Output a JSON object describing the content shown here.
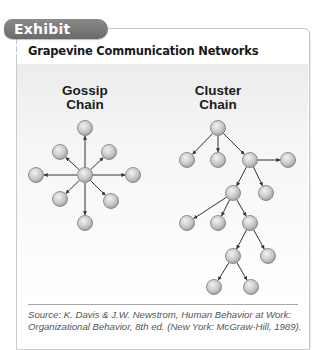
{
  "exhibit": {
    "tab_label": "Exhibit 13.3",
    "title": "Grapevine Communication Networks",
    "source": "Source: K. Davis & J.W. Newstrom, Human Behavior at Work: Organizational Behavior, 8th ed. (New York: McGraw-Hill, 1989).",
    "colors": {
      "tab": "#7a7a7a",
      "node_fill": "#c8c8c8",
      "edge": "#333333",
      "content_bg_top": "#ececec"
    }
  },
  "diagrams": [
    {
      "name": "gossip-chain",
      "label_line1": "Gossip",
      "label_line2": "Chain",
      "structure": "star: one central node sends to eight surrounding nodes",
      "nodes": [
        {
          "id": "center",
          "x": 85,
          "y": 175
        },
        {
          "id": "top",
          "x": 85,
          "y": 128
        },
        {
          "id": "upper-left",
          "x": 60,
          "y": 152
        },
        {
          "id": "upper-right",
          "x": 109,
          "y": 152
        },
        {
          "id": "left",
          "x": 36,
          "y": 175
        },
        {
          "id": "right",
          "x": 133,
          "y": 175
        },
        {
          "id": "lower-left",
          "x": 60,
          "y": 199
        },
        {
          "id": "lower-right",
          "x": 111,
          "y": 201
        },
        {
          "id": "bottom",
          "x": 85,
          "y": 223
        }
      ],
      "edges": [
        [
          "center",
          "top"
        ],
        [
          "center",
          "upper-left"
        ],
        [
          "center",
          "upper-right"
        ],
        [
          "center",
          "left"
        ],
        [
          "center",
          "right"
        ],
        [
          "center",
          "lower-left"
        ],
        [
          "center",
          "lower-right"
        ],
        [
          "center",
          "bottom"
        ]
      ]
    },
    {
      "name": "cluster-chain",
      "label_line1": "Cluster",
      "label_line2": "Chain",
      "structure": "tree: select individuals pass information to a few others",
      "nodes": [
        {
          "id": "n1",
          "x": 218,
          "y": 128
        },
        {
          "id": "n2",
          "x": 187,
          "y": 160
        },
        {
          "id": "n3",
          "x": 218,
          "y": 160
        },
        {
          "id": "n4",
          "x": 250,
          "y": 160
        },
        {
          "id": "n5",
          "x": 288,
          "y": 160
        },
        {
          "id": "n6",
          "x": 233,
          "y": 193
        },
        {
          "id": "n7",
          "x": 266,
          "y": 193
        },
        {
          "id": "n8",
          "x": 187,
          "y": 223
        },
        {
          "id": "n9",
          "x": 218,
          "y": 223
        },
        {
          "id": "n10",
          "x": 250,
          "y": 223
        },
        {
          "id": "n11",
          "x": 233,
          "y": 256
        },
        {
          "id": "n12",
          "x": 268,
          "y": 256
        },
        {
          "id": "n13",
          "x": 214,
          "y": 287
        },
        {
          "id": "n14",
          "x": 251,
          "y": 287
        }
      ],
      "edges": [
        [
          "n1",
          "n2"
        ],
        [
          "n1",
          "n3"
        ],
        [
          "n1",
          "n4"
        ],
        [
          "n4",
          "n5"
        ],
        [
          "n4",
          "n6"
        ],
        [
          "n4",
          "n7"
        ],
        [
          "n6",
          "n8"
        ],
        [
          "n6",
          "n9"
        ],
        [
          "n6",
          "n10"
        ],
        [
          "n10",
          "n11"
        ],
        [
          "n10",
          "n12"
        ],
        [
          "n11",
          "n13"
        ],
        [
          "n11",
          "n14"
        ]
      ]
    }
  ]
}
